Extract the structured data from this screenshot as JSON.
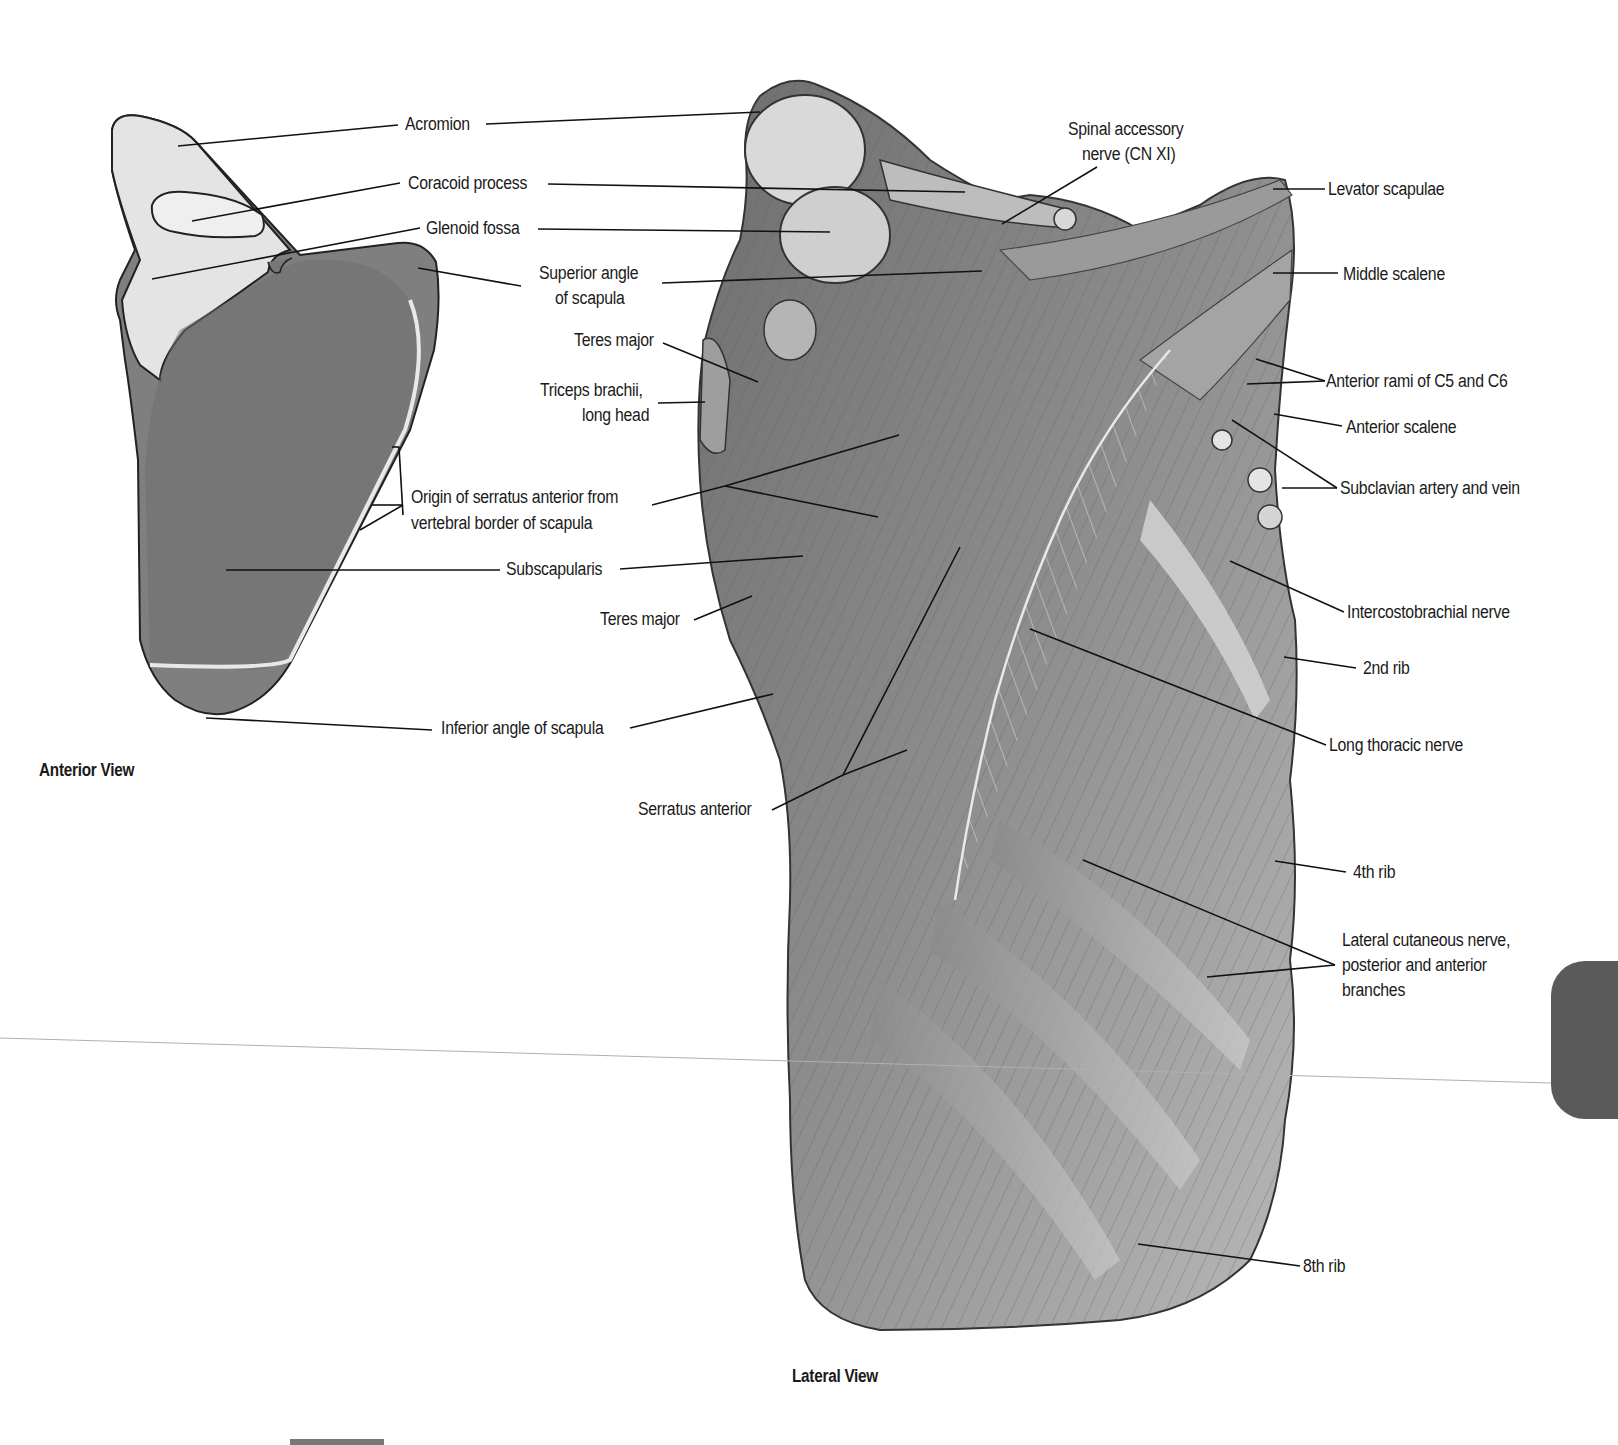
{
  "figure": {
    "views": {
      "anterior": {
        "caption": "Anterior View"
      },
      "lateral": {
        "caption": "Lateral View"
      }
    },
    "colors": {
      "background": "#ffffff",
      "bone_light": "#e6e6e6",
      "bone_shaded": "#7a7a7a",
      "muscle": "#8a8a8a",
      "leader_line": "#111111",
      "section_tab": "#5a5a5a"
    },
    "labels": {
      "acromion": "Acromion",
      "coracoid_process": "Coracoid process",
      "glenoid_fossa": "Glenoid fossa",
      "superior_angle_1": "Superior angle",
      "superior_angle_2": "of scapula",
      "teres_major_upper": "Teres major",
      "triceps_1": "Triceps brachii,",
      "triceps_2": "long head",
      "origin_serratus_1": "Origin of serratus anterior from",
      "origin_serratus_2": "vertebral border of scapula",
      "subscapularis": "Subscapularis",
      "teres_major_lower": "Teres major",
      "inferior_angle": "Inferior angle of scapula",
      "serratus_anterior": "Serratus anterior",
      "spinal_accessory_1": "Spinal accessory",
      "spinal_accessory_2": "nerve (CN XI)",
      "levator_scapulae": "Levator scapulae",
      "middle_scalene": "Middle scalene",
      "anterior_rami": "Anterior rami of C5 and C6",
      "anterior_scalene": "Anterior scalene",
      "subclavian": "Subclavian artery and vein",
      "intercostobrachial": "Intercostobrachial nerve",
      "rib_2": "2nd rib",
      "long_thoracic": "Long thoracic nerve",
      "rib_4": "4th rib",
      "lateral_cutaneous_1": "Lateral cutaneous nerve,",
      "lateral_cutaneous_2": "posterior and anterior",
      "lateral_cutaneous_3": "branches",
      "rib_8": "8th rib"
    }
  }
}
